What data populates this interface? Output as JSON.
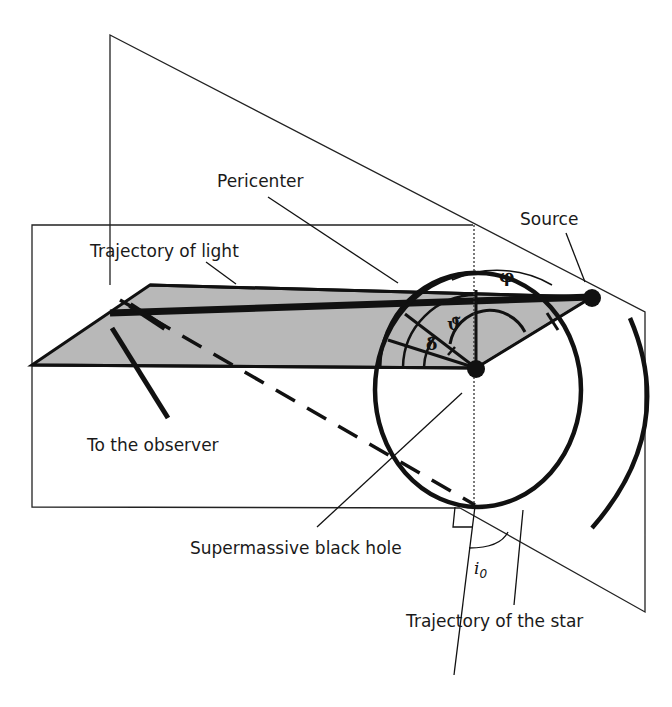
{
  "diagram": {
    "labels": {
      "pericenter": "Pericenter",
      "source": "Source",
      "trajectory_light": "Trajectory of light",
      "to_observer": "To the observer",
      "black_hole": "Supermassive black hole",
      "trajectory_star": "Trajectory of the star"
    },
    "angles": {
      "phi": "φ",
      "theta_tilde": "ϑ̃",
      "delta": "δ̃",
      "inclination_base": "i",
      "inclination_sub": "0"
    },
    "colors": {
      "line": "#111111",
      "shade": "#b8b8b8",
      "background": "#ffffff"
    }
  }
}
